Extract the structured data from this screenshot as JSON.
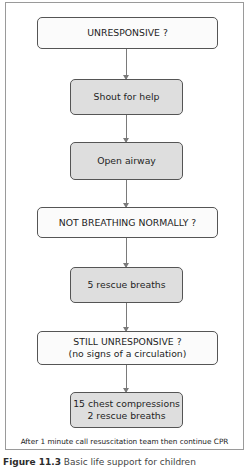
{
  "flowchart": {
    "nodes": [
      {
        "id": "unresponsive",
        "style": "white",
        "lines": [
          "UNRESPONSIVE ?"
        ]
      },
      {
        "id": "shout",
        "style": "gray",
        "lines": [
          "Shout for help"
        ]
      },
      {
        "id": "airway",
        "style": "gray",
        "lines": [
          "Open airway"
        ]
      },
      {
        "id": "not-breathing",
        "style": "white",
        "lines": [
          "NOT BREATHING NORMALLY ?"
        ]
      },
      {
        "id": "rescue-breaths",
        "style": "gray",
        "lines": [
          "5 rescue breaths"
        ]
      },
      {
        "id": "still-unresponsive",
        "style": "white",
        "lines": [
          "STILL UNRESPONSIVE ?",
          "(no signs of a circulation)"
        ]
      },
      {
        "id": "compressions",
        "style": "gray",
        "lines": [
          "15 chest compressions",
          "2 rescue breaths"
        ]
      }
    ],
    "edges": [
      [
        "unresponsive",
        "shout"
      ],
      [
        "shout",
        "airway"
      ],
      [
        "airway",
        "not-breathing"
      ],
      [
        "not-breathing",
        "rescue-breaths"
      ],
      [
        "rescue-breaths",
        "still-unresponsive"
      ],
      [
        "still-unresponsive",
        "compressions"
      ]
    ],
    "footer": "After 1 minute call resuscitation team then continue CPR"
  },
  "caption": {
    "label": "Figure 11.3",
    "text": "Basic life support for children"
  },
  "colors": {
    "box_border": "#555555",
    "gray_fill": "#dedede",
    "white_fill": "#fbfbfb",
    "connector": "#7a7a7a",
    "frame": "#9a9a9a"
  }
}
